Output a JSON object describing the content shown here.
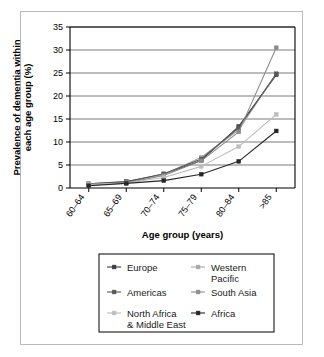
{
  "figure": {
    "background_color": "#ffffff",
    "frame_color": "#b9b9b9",
    "plot_border_color": "#000000",
    "gridline_color": "#7a7a7a"
  },
  "chart_data": {
    "type": "line",
    "title": "",
    "subtitle": "",
    "xlabel": "Age group (years)",
    "ylabel": "Prevalence of dementia within each age group (%)",
    "categories": [
      "60–64",
      "65–69",
      "70–74",
      "75–79",
      "80–84",
      ">85"
    ],
    "xtick_labels": [
      "60–64",
      "65–69",
      "70–74",
      "75–79",
      "80–84",
      ">85"
    ],
    "ytick_labels": [
      "0",
      "5",
      "10",
      "15",
      "20",
      "25",
      "30",
      "35"
    ],
    "ytick_values": [
      0,
      5,
      10,
      15,
      20,
      25,
      30,
      35
    ],
    "ylim": [
      0,
      35
    ],
    "ystep": 5,
    "grid": "horizontal",
    "legend_position": "bottom-center",
    "legend_columns": 2,
    "marker": "square",
    "series": [
      {
        "name": "Europe",
        "color": "#3d3d3d",
        "values": [
          0.9,
          1.4,
          3.0,
          6.0,
          13.4,
          24.6
        ]
      },
      {
        "name": "Western Pacific",
        "color": "#a8a8a8",
        "values": [
          0.6,
          1.2,
          2.9,
          6.7,
          12.6,
          24.9
        ]
      },
      {
        "name": "Americas",
        "color": "#585858",
        "values": [
          0.9,
          1.3,
          3.1,
          6.3,
          13.1,
          24.8
        ]
      },
      {
        "name": "South Asia",
        "color": "#8c8c8c",
        "values": [
          0.6,
          1.1,
          2.7,
          5.9,
          12.2,
          30.5
        ]
      },
      {
        "name": "North Africa & Middle East",
        "color": "#bdbdbd",
        "values": [
          0.8,
          1.1,
          2.3,
          4.7,
          9.0,
          16.0
        ]
      },
      {
        "name": "Africa",
        "color": "#262626",
        "values": [
          0.5,
          1.0,
          1.6,
          3.0,
          5.8,
          12.4
        ]
      }
    ]
  },
  "legend": {
    "entries": [
      {
        "label": "Europe"
      },
      {
        "label": "Western Pacific"
      },
      {
        "label": "Americas"
      },
      {
        "label": "South Asia"
      },
      {
        "label": "North Africa & Middle East"
      },
      {
        "label": "Africa"
      }
    ]
  }
}
